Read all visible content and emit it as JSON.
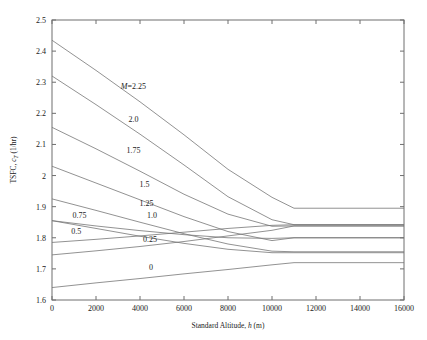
{
  "chart_data": {
    "type": "line",
    "title": "",
    "xlabel": "Standard Altitude, h (m)",
    "ylabel": "TSFC, c_T (1/hr)",
    "ylabel_parts": {
      "prefix": "TSFC, ",
      "symbol": "c",
      "subscript": "T",
      "suffix": " (1/hr)"
    },
    "xlabel_parts": {
      "prefix": "Standard Altitude, ",
      "symbol": "h",
      "suffix": " (m)"
    },
    "xlim": [
      0,
      16000
    ],
    "ylim": [
      1.6,
      2.5
    ],
    "xticks": [
      0,
      2000,
      4000,
      6000,
      8000,
      10000,
      12000,
      14000,
      16000
    ],
    "xtick_labels": [
      "0",
      "2000",
      "4000",
      "6000",
      "8000",
      "10000",
      "12000",
      "14000",
      "16000"
    ],
    "yticks": [
      1.6,
      1.7,
      1.8,
      1.9,
      2.0,
      2.1,
      2.2,
      2.3,
      2.4,
      2.5
    ],
    "ytick_labels": [
      "1.6",
      "1.7",
      "1.8",
      "1.9",
      "2",
      "2.1",
      "2.2",
      "2.3",
      "2.4",
      "2.5"
    ],
    "grid": false,
    "legend": "inline-curve-labels",
    "tropopause_altitude": 11000,
    "series": [
      {
        "name": "M=2.25",
        "label": "2.25",
        "label_prefix": "M=",
        "label_x": 3700,
        "label_y": 2.278,
        "x": [
          0,
          2000,
          4000,
          6000,
          8000,
          10000,
          11000,
          13000,
          16000
        ],
        "y": [
          2.435,
          2.338,
          2.237,
          2.131,
          2.02,
          1.93,
          1.895,
          1.895,
          1.895
        ]
      },
      {
        "name": "M=2.0",
        "label": "2.0",
        "label_prefix": "",
        "label_x": 3700,
        "label_y": 2.172,
        "x": [
          0,
          2000,
          4000,
          6000,
          8000,
          10000,
          11000,
          13000,
          16000
        ],
        "y": [
          2.32,
          2.228,
          2.133,
          2.034,
          1.932,
          1.858,
          1.842,
          1.842,
          1.842
        ]
      },
      {
        "name": "M=1.75",
        "label": "1.75",
        "label_prefix": "",
        "label_x": 3700,
        "label_y": 2.072,
        "x": [
          0,
          2000,
          4000,
          6000,
          8000,
          10000,
          11000,
          13000,
          16000
        ],
        "y": [
          2.155,
          2.086,
          2.014,
          1.94,
          1.876,
          1.837,
          1.838,
          1.838,
          1.838
        ]
      },
      {
        "name": "M=1.5",
        "label": "1.5",
        "label_prefix": "",
        "label_x": 4200,
        "label_y": 1.962,
        "x": [
          0,
          2000,
          4000,
          6000,
          8000,
          10000,
          11000,
          13000,
          16000
        ],
        "y": [
          2.03,
          1.976,
          1.922,
          1.868,
          1.82,
          1.791,
          1.8,
          1.8,
          1.8
        ]
      },
      {
        "name": "M=1.25",
        "label": "1.25",
        "label_prefix": "",
        "label_x": 4300,
        "label_y": 1.901,
        "x": [
          0,
          2000,
          4000,
          6000,
          8000,
          10000,
          11000,
          13000,
          16000
        ],
        "y": [
          1.925,
          1.888,
          1.85,
          1.813,
          1.78,
          1.757,
          1.755,
          1.755,
          1.755
        ]
      },
      {
        "name": "M=1.0",
        "label": "1.0",
        "label_prefix": "",
        "label_x": 4550,
        "label_y": 1.862,
        "x": [
          0,
          2000,
          4000,
          6000,
          8000,
          10000,
          11000,
          13000,
          16000
        ],
        "y": [
          1.855,
          1.83,
          1.805,
          1.782,
          1.763,
          1.752,
          1.752,
          1.752,
          1.752
        ]
      },
      {
        "name": "M=0.75",
        "label": "0.75",
        "label_prefix": "",
        "label_x": 1250,
        "label_y": 1.862,
        "x": [
          0,
          2000,
          4000,
          6000,
          8000,
          10000,
          11000,
          13000,
          16000
        ],
        "y": [
          1.855,
          1.838,
          1.823,
          1.81,
          1.8,
          1.798,
          1.8,
          1.8,
          1.8
        ]
      },
      {
        "name": "M=0.5",
        "label": "0.5",
        "label_prefix": "",
        "label_x": 1100,
        "label_y": 1.811,
        "x": [
          0,
          2000,
          4000,
          6000,
          8000,
          10000,
          11000,
          13000,
          16000
        ],
        "y": [
          1.785,
          1.795,
          1.806,
          1.818,
          1.83,
          1.84,
          1.842,
          1.842,
          1.842
        ]
      },
      {
        "name": "M=0.25",
        "label": "0.25",
        "label_prefix": "",
        "label_x": 4450,
        "label_y": 1.788,
        "x": [
          0,
          2000,
          4000,
          6000,
          8000,
          10000,
          11000,
          13000,
          16000
        ],
        "y": [
          1.745,
          1.758,
          1.772,
          1.788,
          1.806,
          1.824,
          1.838,
          1.838,
          1.838
        ]
      },
      {
        "name": "M=0",
        "label": "0",
        "label_prefix": "",
        "label_x": 4500,
        "label_y": 1.696,
        "x": [
          0,
          2000,
          4000,
          6000,
          8000,
          10000,
          11000,
          13000,
          16000
        ],
        "y": [
          1.64,
          1.655,
          1.669,
          1.684,
          1.698,
          1.713,
          1.72,
          1.72,
          1.72
        ]
      }
    ]
  }
}
